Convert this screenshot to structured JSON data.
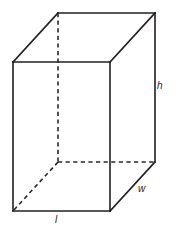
{
  "figure": {
    "kind": "rectangular-prism-diagram",
    "stroke_color": "#231f20",
    "hidden_stroke_color": "#2b2728",
    "background_color": "#ffffff",
    "canvas": {
      "width": 174,
      "height": 236
    },
    "vertices": {
      "front_top_left": [
        13,
        62
      ],
      "front_top_right": [
        110,
        62
      ],
      "front_bottom_right": [
        110,
        211
      ],
      "front_bottom_left": [
        13,
        211
      ],
      "back_top_left": [
        58,
        13
      ],
      "back_top_right": [
        155,
        13
      ],
      "back_bottom_right": [
        155,
        162
      ],
      "back_bottom_left_hidden": [
        58,
        162
      ]
    },
    "solid_edges": [
      [
        [
          13,
          62
        ],
        [
          110,
          62
        ]
      ],
      [
        [
          110,
          62
        ],
        [
          110,
          211
        ]
      ],
      [
        [
          110,
          211
        ],
        [
          13,
          211
        ]
      ],
      [
        [
          13,
          211
        ],
        [
          13,
          62
        ]
      ],
      [
        [
          58,
          13
        ],
        [
          155,
          13
        ]
      ],
      [
        [
          155,
          13
        ],
        [
          155,
          162
        ]
      ],
      [
        [
          13,
          62
        ],
        [
          58,
          13
        ]
      ],
      [
        [
          110,
          62
        ],
        [
          155,
          13
        ]
      ],
      [
        [
          110,
          211
        ],
        [
          155,
          162
        ]
      ]
    ],
    "hidden_edges": [
      [
        [
          58,
          13
        ],
        [
          58,
          162
        ]
      ],
      [
        [
          58,
          162
        ],
        [
          155,
          162
        ]
      ],
      [
        [
          58,
          162
        ],
        [
          13,
          211
        ]
      ]
    ],
    "labels": {
      "height": "h",
      "width": "w",
      "length": "l"
    }
  }
}
